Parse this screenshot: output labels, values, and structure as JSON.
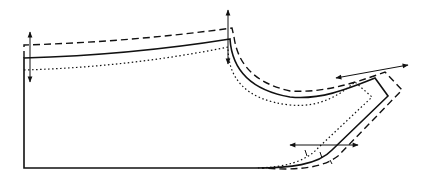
{
  "diagram": {
    "type": "pattern-grading",
    "colors": {
      "line": "#111111",
      "background": "#ffffff"
    },
    "outlines": [
      {
        "name": "base-size",
        "style": "solid"
      },
      {
        "name": "larger-size",
        "style": "dashed"
      },
      {
        "name": "smaller-size",
        "style": "dotted"
      }
    ],
    "arrows": [
      {
        "name": "left-edge-vertical-arrow",
        "direction": "vertical"
      },
      {
        "name": "top-corner-vertical-arrow",
        "direction": "vertical"
      },
      {
        "name": "right-top-diagonal-arrow",
        "direction": "horizontal"
      },
      {
        "name": "right-bottom-horizontal-arrow",
        "direction": "horizontal"
      }
    ]
  }
}
